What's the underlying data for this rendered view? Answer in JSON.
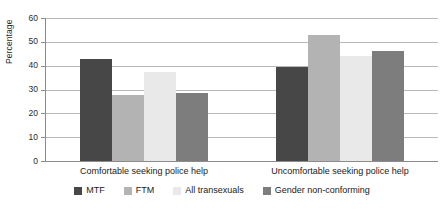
{
  "chart_data": {
    "type": "bar",
    "title": "",
    "subtitle": "",
    "xlabel": "",
    "ylabel": "Percentage",
    "ylim": [
      0,
      60
    ],
    "ytick_step": 10,
    "yticks": [
      0,
      10,
      20,
      30,
      40,
      50,
      60
    ],
    "ytick_labels": [
      "0",
      "10",
      "20",
      "30",
      "40",
      "50",
      "60"
    ],
    "grid": "horizontal",
    "legend_position": "bottom",
    "categories": [
      "Comfortable seeking police help",
      "Uncomfortable seeking police help"
    ],
    "series": [
      {
        "name": "MTF",
        "color": "#474747",
        "values": [
          43.0,
          39.5
        ]
      },
      {
        "name": "FTM",
        "color": "#b3b3b3",
        "values": [
          27.5,
          53.0
        ]
      },
      {
        "name": "All transexuals",
        "color": "#e9e9e9",
        "values": [
          37.5,
          44.0
        ]
      },
      {
        "name": "Gender non-conforming",
        "color": "#7d7d7d",
        "values": [
          28.5,
          46.0
        ]
      }
    ]
  },
  "axis": {
    "y_title": "Percentage"
  }
}
